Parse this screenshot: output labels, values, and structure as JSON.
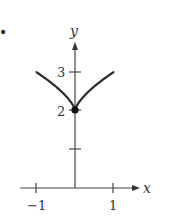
{
  "bullet": "•",
  "chart_data": {
    "type": "line",
    "title": "",
    "xlabel": "x",
    "ylabel": "y",
    "xlim": [
      -1.4,
      1.4
    ],
    "ylim": [
      0,
      3.8
    ],
    "x_ticks": [
      -1,
      1
    ],
    "x_tick_labels": [
      "−1",
      "1"
    ],
    "y_ticks": [
      1,
      2,
      3
    ],
    "y_tick_labels": [
      "",
      "2",
      "3"
    ],
    "grid": false,
    "series": [
      {
        "name": "y = 2 + |x|^(2/3)",
        "x": [
          -1,
          -0.75,
          -0.5,
          -0.25,
          -0.1,
          0,
          0.1,
          0.25,
          0.5,
          0.75,
          1
        ],
        "values": [
          3,
          2.83,
          2.63,
          2.4,
          2.22,
          2,
          2.22,
          2.4,
          2.63,
          2.83,
          3
        ]
      }
    ],
    "annotations": [
      {
        "type": "point",
        "x": 0,
        "y": 2,
        "filled": true
      }
    ]
  }
}
